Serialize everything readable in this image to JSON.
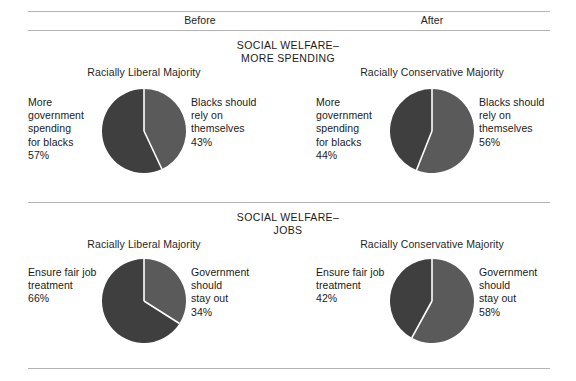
{
  "figure": {
    "background": "#ffffff",
    "rule_color": "#b4b4b4",
    "dark_slice_color": "#3f3f3f",
    "light_slice_color": "#5a5a5a",
    "divider_color": "#ffffff"
  },
  "header": {
    "before_label": "Before",
    "after_label": "After"
  },
  "sections": [
    {
      "title_line1": "SOCIAL WELFARE–",
      "title_line2": "MORE SPENDING",
      "charts": [
        {
          "group_title": "Racially Liberal Majority",
          "left_label_lines": [
            "More",
            "government",
            "spending",
            "for blacks",
            "57%"
          ],
          "right_label_lines": [
            "Blacks should",
            "rely on",
            "themselves",
            "43%"
          ]
        },
        {
          "group_title": "Racially Conservative Majority",
          "left_label_lines": [
            "More",
            "government",
            "spending",
            "for blacks",
            "44%"
          ],
          "right_label_lines": [
            "Blacks should",
            "rely on",
            "themselves",
            "56%"
          ]
        }
      ]
    },
    {
      "title_line1": "SOCIAL WELFARE–",
      "title_line2": "JOBS",
      "charts": [
        {
          "group_title": "Racially Liberal Majority",
          "left_label_lines": [
            "Ensure fair job",
            "treatment",
            "66%"
          ],
          "right_label_lines": [
            "Government",
            "should",
            "stay out",
            "34%"
          ]
        },
        {
          "group_title": "Racially Conservative Majority",
          "left_label_lines": [
            "Ensure fair job",
            "treatment",
            "42%"
          ],
          "right_label_lines": [
            "Government",
            "should",
            "stay out",
            "58%"
          ]
        }
      ]
    }
  ],
  "chart_data": [
    {
      "type": "pie",
      "title": "SOCIAL WELFARE–MORE SPENDING — Racially Liberal Majority (Before)",
      "categories": [
        "More government spending for blacks",
        "Blacks should rely on themselves"
      ],
      "values": [
        57,
        43
      ],
      "unit": "%",
      "colors": [
        "#3f3f3f",
        "#5a5a5a"
      ],
      "legend": "labels placed beside pie",
      "start_angle_deg": 0,
      "direction": "first slice counter-clockwise from 12 o'clock"
    },
    {
      "type": "pie",
      "title": "SOCIAL WELFARE–MORE SPENDING — Racially Conservative Majority (After)",
      "categories": [
        "More government spending for blacks",
        "Blacks should rely on themselves"
      ],
      "values": [
        44,
        56
      ],
      "unit": "%",
      "colors": [
        "#3f3f3f",
        "#5a5a5a"
      ],
      "legend": "labels placed beside pie",
      "start_angle_deg": 0,
      "direction": "first slice counter-clockwise from 12 o'clock"
    },
    {
      "type": "pie",
      "title": "SOCIAL WELFARE–JOBS — Racially Liberal Majority (Before)",
      "categories": [
        "Ensure fair job treatment",
        "Government should stay out"
      ],
      "values": [
        66,
        34
      ],
      "unit": "%",
      "colors": [
        "#3f3f3f",
        "#5a5a5a"
      ],
      "legend": "labels placed beside pie",
      "start_angle_deg": 0,
      "direction": "first slice counter-clockwise from 12 o'clock"
    },
    {
      "type": "pie",
      "title": "SOCIAL WELFARE–JOBS — Racially Conservative Majority (After)",
      "categories": [
        "Ensure fair job treatment",
        "Government should stay out"
      ],
      "values": [
        42,
        58
      ],
      "unit": "%",
      "colors": [
        "#3f3f3f",
        "#5a5a5a"
      ],
      "legend": "labels placed beside pie",
      "start_angle_deg": 0,
      "direction": "first slice counter-clockwise from 12 o'clock"
    }
  ]
}
